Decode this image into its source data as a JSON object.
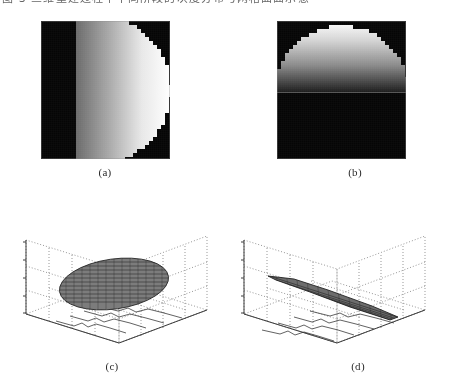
{
  "document": {
    "top_caption_clipped": "图 3 三维重建过程中不同阶段的灰度分布与网格曲面示意",
    "background_color": "#ffffff"
  },
  "figure": {
    "panels": [
      {
        "id": "a",
        "label": "(a)",
        "type": "grayscale-image",
        "description": "right half-disc, horizontal gradient dark-to-bright",
        "x": 41,
        "y": 21,
        "width": 129,
        "height": 138,
        "background_color": "#050505",
        "gradient_direction": "horizontal",
        "gradient_from": "#2a2a2a",
        "gradient_to": "#ffffff"
      },
      {
        "id": "b",
        "label": "(b)",
        "type": "grayscale-image",
        "description": "upper half-disc, vertical gradient bright-to-dark",
        "x": 277,
        "y": 21,
        "width": 129,
        "height": 138,
        "background_color": "#050505",
        "gradient_direction": "vertical",
        "gradient_from": "#ffffff",
        "gradient_to": "#1a1a1a"
      },
      {
        "id": "c",
        "label": "(c)",
        "type": "3d-mesh-plot",
        "description": "flat tilted elliptical disc surface over dotted grid box",
        "x": 14,
        "y": 222,
        "width": 200,
        "height": 132,
        "surface_shape": "ellipse",
        "surface_color": "#6a6a6a",
        "grid_style": "dotted",
        "axis_color": "#555555"
      },
      {
        "id": "d",
        "label": "(d)",
        "type": "3d-mesh-plot",
        "description": "narrow edge-on strip surface over dotted grid box",
        "x": 232,
        "y": 222,
        "width": 200,
        "height": 132,
        "surface_shape": "narrow-strip",
        "surface_color": "#5e5e5e",
        "grid_style": "dotted",
        "axis_color": "#555555"
      }
    ],
    "labels": {
      "a": "(a)",
      "b": "(b)",
      "c": "(c)",
      "d": "(d)"
    }
  },
  "chart_data": [
    {
      "type": "heatmap",
      "panel": "a",
      "title": "(a)",
      "xlabel": "",
      "ylabel": "",
      "grid": false,
      "legend": "none",
      "colormap": "gray",
      "value_range": [
        0,
        255
      ],
      "description": "Circular aperture occupying the right portion of the frame; intensity increases monotonically from left (dark, ~40) to right (saturated white, 255). Region outside the circle is near-black (~5). Circle boundary is quantized into blocky pixel steps.",
      "notes": "background ~5, disc left edge ~60, disc right edge ~255"
    },
    {
      "type": "heatmap",
      "panel": "b",
      "title": "(b)",
      "xlabel": "",
      "ylabel": "",
      "grid": false,
      "legend": "none",
      "colormap": "gray",
      "value_range": [
        0,
        255
      ],
      "description": "Upper half of a circular aperture; intensity is highest at the top (255) and decreases downward to near-black (~25) at the horizontal mid-line. Lower half of the frame is black (~5).",
      "notes": "top ~255, mid ~30, lower half ~5"
    },
    {
      "type": "line",
      "panel": "c",
      "title": "(c)",
      "xlabel": "",
      "ylabel": "",
      "zlabel": "",
      "grid": true,
      "legend": "none",
      "description": "MATLAB-style 3D mesh of a flat circular plateau rendered as a tilted ellipse at a constant mid height, surrounded by a dotted grid box with tick marks on the vertical axis and faint profile traces on the floor plane.",
      "x": [
        0,
        25,
        50,
        75,
        100
      ],
      "series": [
        {
          "name": "surface-height",
          "values": [
            0.5,
            0.5,
            0.5,
            0.5,
            0.5
          ]
        }
      ],
      "zlim": [
        0,
        1
      ]
    },
    {
      "type": "line",
      "panel": "d",
      "title": "(d)",
      "xlabel": "",
      "ylabel": "",
      "zlabel": "",
      "grid": true,
      "legend": "none",
      "description": "MATLAB-style 3D mesh showing a narrow elongated strip viewed nearly edge-on, sloping downward from upper-left to lower-right inside the same dotted grid box, with faint profile traces on the floor plane.",
      "x": [
        0,
        25,
        50,
        75,
        100
      ],
      "series": [
        {
          "name": "surface-height",
          "values": [
            0.62,
            0.52,
            0.42,
            0.32,
            0.22
          ]
        }
      ],
      "zlim": [
        0,
        1
      ]
    }
  ]
}
